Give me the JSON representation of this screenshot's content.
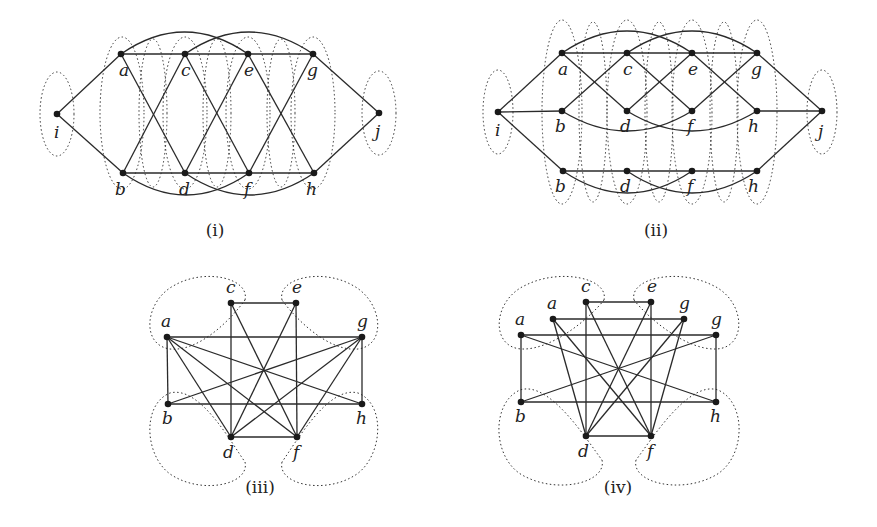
{
  "figure": {
    "panels": [
      {
        "caption": "(i)",
        "nodes": [
          {
            "id": "a",
            "label": "a",
            "x": 121,
            "y": 54,
            "lx": -2,
            "ly": 22
          },
          {
            "id": "c",
            "label": "c",
            "x": 185,
            "y": 54,
            "lx": -4,
            "ly": 22
          },
          {
            "id": "e",
            "label": "e",
            "x": 248,
            "y": 54,
            "lx": -4,
            "ly": 22
          },
          {
            "id": "g",
            "label": "g",
            "x": 313,
            "y": 54,
            "lx": -6,
            "ly": 22
          },
          {
            "id": "i",
            "label": "i",
            "x": 57,
            "y": 114,
            "lx": -3,
            "ly": 24
          },
          {
            "id": "j",
            "label": "j",
            "x": 379,
            "y": 113,
            "lx": -4,
            "ly": 24
          },
          {
            "id": "b",
            "label": "b",
            "x": 123,
            "y": 173,
            "lx": -8,
            "ly": 22
          },
          {
            "id": "d",
            "label": "d",
            "x": 185,
            "y": 173,
            "lx": -6,
            "ly": 22
          },
          {
            "id": "f",
            "label": "f",
            "x": 249,
            "y": 173,
            "lx": -5,
            "ly": 22
          },
          {
            "id": "h",
            "label": "h",
            "x": 314,
            "y": 173,
            "lx": -8,
            "ly": 22
          }
        ],
        "edges": [
          [
            "a",
            "c"
          ],
          [
            "c",
            "e"
          ],
          [
            "e",
            "g"
          ],
          [
            "b",
            "d"
          ],
          [
            "d",
            "f"
          ],
          [
            "f",
            "h"
          ],
          [
            "i",
            "a"
          ],
          [
            "i",
            "b"
          ],
          [
            "g",
            "j"
          ],
          [
            "h",
            "j"
          ],
          [
            "a",
            "d"
          ],
          [
            "b",
            "c"
          ],
          [
            "c",
            "f"
          ],
          [
            "d",
            "e"
          ],
          [
            "e",
            "h"
          ],
          [
            "f",
            "g"
          ]
        ],
        "arcs": [
          [
            "a",
            "e",
            -22
          ],
          [
            "c",
            "g",
            -22
          ],
          [
            "b",
            "f",
            22
          ],
          [
            "d",
            "h",
            22
          ]
        ],
        "ellipses": [
          {
            "cx": 57,
            "cy": 114,
            "rx": 17,
            "ry": 42
          },
          {
            "cx": 122,
            "cy": 113,
            "rx": 22,
            "ry": 76
          },
          {
            "cx": 185,
            "cy": 113,
            "rx": 22,
            "ry": 76
          },
          {
            "cx": 248,
            "cy": 113,
            "rx": 22,
            "ry": 76
          },
          {
            "cx": 313,
            "cy": 113,
            "rx": 22,
            "ry": 76
          },
          {
            "cx": 379,
            "cy": 113,
            "rx": 17,
            "ry": 42
          },
          {
            "cx": 153,
            "cy": 113,
            "rx": 14,
            "ry": 74
          },
          {
            "cx": 217,
            "cy": 113,
            "rx": 14,
            "ry": 74
          },
          {
            "cx": 281,
            "cy": 113,
            "rx": 14,
            "ry": 74
          }
        ],
        "caption_x": 215,
        "caption_y": 236
      },
      {
        "caption": "(ii)",
        "nodes": [
          {
            "id": "a",
            "label": "a",
            "x": 562,
            "y": 53,
            "lx": -4,
            "ly": 22
          },
          {
            "id": "c",
            "label": "c",
            "x": 627,
            "y": 53,
            "lx": -4,
            "ly": 22
          },
          {
            "id": "e",
            "label": "e",
            "x": 692,
            "y": 53,
            "lx": -4,
            "ly": 22
          },
          {
            "id": "g",
            "label": "g",
            "x": 757,
            "y": 53,
            "lx": -6,
            "ly": 22
          },
          {
            "id": "i",
            "label": "i",
            "x": 498,
            "y": 112,
            "lx": -3,
            "ly": 24
          },
          {
            "id": "b",
            "label": "b",
            "x": 562,
            "y": 111,
            "lx": -7,
            "ly": 21
          },
          {
            "id": "d",
            "label": "d",
            "x": 627,
            "y": 111,
            "lx": -7,
            "ly": 21
          },
          {
            "id": "f",
            "label": "f",
            "x": 692,
            "y": 111,
            "lx": -5,
            "ly": 21
          },
          {
            "id": "h",
            "label": "h",
            "x": 757,
            "y": 111,
            "lx": -9,
            "ly": 21
          },
          {
            "id": "j",
            "label": "j",
            "x": 822,
            "y": 111,
            "lx": -4,
            "ly": 26
          },
          {
            "id": "b2",
            "label": "b",
            "x": 563,
            "y": 171,
            "lx": -8,
            "ly": 21
          },
          {
            "id": "d2",
            "label": "d",
            "x": 627,
            "y": 171,
            "lx": -7,
            "ly": 21
          },
          {
            "id": "f2",
            "label": "f",
            "x": 692,
            "y": 171,
            "lx": -5,
            "ly": 21
          },
          {
            "id": "h2",
            "label": "h",
            "x": 757,
            "y": 171,
            "lx": -9,
            "ly": 21
          }
        ],
        "edges": [
          [
            "a",
            "c"
          ],
          [
            "c",
            "e"
          ],
          [
            "e",
            "g"
          ],
          [
            "i",
            "a"
          ],
          [
            "i",
            "b"
          ],
          [
            "i",
            "b2"
          ],
          [
            "g",
            "j"
          ],
          [
            "h",
            "j"
          ],
          [
            "h2",
            "j"
          ],
          [
            "b2",
            "d2"
          ],
          [
            "d2",
            "f2"
          ],
          [
            "f2",
            "h2"
          ],
          [
            "a",
            "d"
          ],
          [
            "b",
            "c"
          ],
          [
            "c",
            "f"
          ],
          [
            "d",
            "e"
          ],
          [
            "e",
            "h"
          ],
          [
            "f",
            "g"
          ]
        ],
        "arcs": [
          [
            "a",
            "e",
            -22
          ],
          [
            "c",
            "g",
            -22
          ],
          [
            "b",
            "f",
            20
          ],
          [
            "d",
            "h",
            20
          ],
          [
            "b2",
            "f2",
            22
          ],
          [
            "d2",
            "h2",
            22
          ]
        ],
        "ellipses": [
          {
            "cx": 498,
            "cy": 112,
            "rx": 15,
            "ry": 42
          },
          {
            "cx": 562,
            "cy": 112,
            "rx": 20,
            "ry": 92
          },
          {
            "cx": 627,
            "cy": 112,
            "rx": 20,
            "ry": 92
          },
          {
            "cx": 692,
            "cy": 112,
            "rx": 20,
            "ry": 92
          },
          {
            "cx": 757,
            "cy": 112,
            "rx": 20,
            "ry": 92
          },
          {
            "cx": 822,
            "cy": 112,
            "rx": 15,
            "ry": 42
          },
          {
            "cx": 593,
            "cy": 112,
            "rx": 14,
            "ry": 90
          },
          {
            "cx": 659,
            "cy": 112,
            "rx": 14,
            "ry": 90
          },
          {
            "cx": 724,
            "cy": 112,
            "rx": 14,
            "ry": 90
          }
        ],
        "caption_x": 656,
        "caption_y": 236
      },
      {
        "caption": "(iii)",
        "nodes": [
          {
            "id": "c",
            "label": "c",
            "x": 231,
            "y": 303,
            "lx": -5,
            "ly": -10
          },
          {
            "id": "e",
            "label": "e",
            "x": 296,
            "y": 303,
            "lx": -4,
            "ly": -10
          },
          {
            "id": "a",
            "label": "a",
            "x": 167,
            "y": 337,
            "lx": -6,
            "ly": -10
          },
          {
            "id": "g",
            "label": "g",
            "x": 362,
            "y": 337,
            "lx": -5,
            "ly": -10
          },
          {
            "id": "b",
            "label": "b",
            "x": 168,
            "y": 404,
            "lx": -6,
            "ly": 20
          },
          {
            "id": "h",
            "label": "h",
            "x": 362,
            "y": 404,
            "lx": -6,
            "ly": 20
          },
          {
            "id": "d",
            "label": "d",
            "x": 231,
            "y": 437,
            "lx": -8,
            "ly": 21
          },
          {
            "id": "f",
            "label": "f",
            "x": 297,
            "y": 437,
            "lx": -4,
            "ly": 21
          }
        ],
        "edges": [
          [
            "c",
            "e"
          ],
          [
            "c",
            "d"
          ],
          [
            "c",
            "f"
          ],
          [
            "e",
            "f"
          ],
          [
            "e",
            "d"
          ],
          [
            "a",
            "g"
          ],
          [
            "a",
            "b"
          ],
          [
            "a",
            "d"
          ],
          [
            "a",
            "f"
          ],
          [
            "a",
            "h"
          ],
          [
            "g",
            "h"
          ],
          [
            "g",
            "b"
          ],
          [
            "g",
            "d"
          ],
          [
            "g",
            "f"
          ],
          [
            "b",
            "h"
          ],
          [
            "d",
            "f"
          ]
        ],
        "blobs": [
          "M 245 300 C 250 278 205 268 175 285 C 145 300 140 345 170 349 C 200 352 232 318 245 300 Z",
          "M 282 300 C 277 278 322 268 352 285 C 382 300 388 345 358 349 C 328 352 295 318 282 300 Z",
          "M 245 462 C 250 484 205 494 175 477 C 145 462 140 405 170 393 C 200 385 232 444 245 462 Z",
          "M 282 462 C 277 484 322 494 352 477 C 382 462 388 405 358 393 C 328 385 295 444 282 462 Z"
        ],
        "caption_x": 260,
        "caption_y": 493
      },
      {
        "caption": "(iv)",
        "nodes": [
          {
            "id": "c",
            "label": "c",
            "x": 586,
            "y": 302,
            "lx": -5,
            "ly": -10
          },
          {
            "id": "e",
            "label": "e",
            "x": 651,
            "y": 302,
            "lx": -4,
            "ly": -10
          },
          {
            "id": "a2",
            "label": "a",
            "x": 553,
            "y": 319,
            "lx": -6,
            "ly": -10
          },
          {
            "id": "g2",
            "label": "g",
            "x": 684,
            "y": 319,
            "lx": -5,
            "ly": -10
          },
          {
            "id": "a",
            "label": "a",
            "x": 521,
            "y": 335,
            "lx": -6,
            "ly": -10
          },
          {
            "id": "g",
            "label": "g",
            "x": 716,
            "y": 335,
            "lx": -5,
            "ly": -10
          },
          {
            "id": "b",
            "label": "b",
            "x": 521,
            "y": 402,
            "lx": -6,
            "ly": 20
          },
          {
            "id": "h",
            "label": "h",
            "x": 716,
            "y": 402,
            "lx": -6,
            "ly": 20
          },
          {
            "id": "d",
            "label": "d",
            "x": 586,
            "y": 436,
            "lx": -8,
            "ly": 21
          },
          {
            "id": "f",
            "label": "f",
            "x": 651,
            "y": 436,
            "lx": -4,
            "ly": 21
          }
        ],
        "edges": [
          [
            "c",
            "e"
          ],
          [
            "c",
            "d"
          ],
          [
            "c",
            "f"
          ],
          [
            "e",
            "f"
          ],
          [
            "e",
            "d"
          ],
          [
            "a2",
            "g2"
          ],
          [
            "a2",
            "d"
          ],
          [
            "a2",
            "f"
          ],
          [
            "g2",
            "d"
          ],
          [
            "g2",
            "f"
          ],
          [
            "a",
            "g"
          ],
          [
            "a",
            "b"
          ],
          [
            "a",
            "h"
          ],
          [
            "g",
            "h"
          ],
          [
            "g",
            "b"
          ],
          [
            "b",
            "h"
          ],
          [
            "d",
            "f"
          ]
        ],
        "blobs": [
          "M 604 300 C 609 278 560 268 526 285 C 492 300 490 348 522 349 C 552 350 590 318 604 300 Z",
          "M 634 300 C 629 278 678 268 712 285 C 746 300 748 348 716 349 C 686 350 648 318 634 300 Z",
          "M 602 460 C 607 482 560 494 526 477 C 492 462 490 403 520 390 C 550 380 588 442 602 460 Z",
          "M 636 460 C 631 482 678 494 712 477 C 746 462 748 403 718 390 C 688 380 650 442 636 460 Z"
        ],
        "caption_x": 618,
        "caption_y": 493
      }
    ]
  }
}
